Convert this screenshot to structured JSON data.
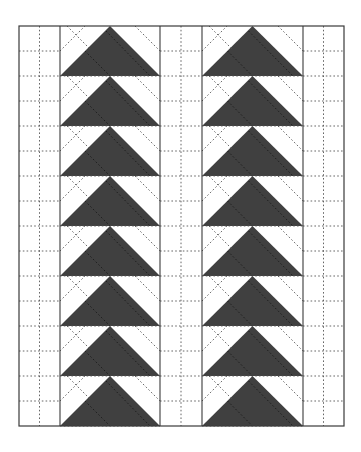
{
  "diagram": {
    "title": "",
    "type": "quilt-layout",
    "colors": {
      "background": "#ffffff",
      "goose_fill": "#404040",
      "line": "#3a3a3a",
      "dotted_line": "#555555"
    },
    "frame": {
      "x": 19,
      "y": 26,
      "width": 325,
      "height": 400
    },
    "strips": [
      {
        "name": "left-sashing",
        "x": 19,
        "width": 41
      },
      {
        "name": "middle-sashing",
        "x": 160,
        "width": 42
      },
      {
        "name": "right-sashing",
        "x": 303,
        "width": 41
      }
    ],
    "goose_columns": [
      {
        "name": "left-geese-column",
        "x": 60,
        "width": 100
      },
      {
        "name": "right-geese-column",
        "x": 202,
        "width": 101
      }
    ],
    "rows": 8,
    "row_height": 50,
    "sashing_subdivisions": 16,
    "geese_direction": "up",
    "geese_count": 16
  }
}
